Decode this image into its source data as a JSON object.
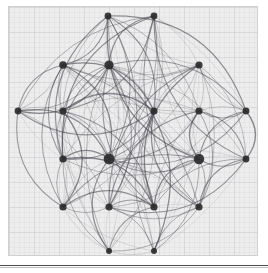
{
  "figure": {
    "title": "",
    "background_color": "#ededed",
    "page_color": "#ffffff",
    "border_color": "#d0d0d0",
    "rule_color": "#4a4a4a",
    "grid_visible": true,
    "grid_color": "#9696a0",
    "grid_major_step": 25,
    "grid_minor_step": 5
  },
  "chart_data": {
    "type": "scatter",
    "title": "",
    "subtitle": "",
    "xlabel": "",
    "ylabel": "",
    "xlim": [
      0,
      250
    ],
    "ylim": [
      0,
      250
    ],
    "grid": true,
    "legend_position": "none",
    "annotations": [],
    "tick_labels_x": [],
    "tick_labels_y": [],
    "node_color": "#2b2b2b",
    "edge_color": "#4a4a55",
    "node_count": 20,
    "edge_count": 150,
    "nodes": [
      {
        "id": "n0",
        "label": "",
        "x": 99,
        "y": 9,
        "size": 3.4,
        "degree": 14
      },
      {
        "id": "n1",
        "label": "",
        "x": 145,
        "y": 9,
        "size": 3.4,
        "degree": 13
      },
      {
        "id": "n2",
        "label": "",
        "x": 54,
        "y": 58,
        "size": 3.8,
        "degree": 16
      },
      {
        "id": "n3",
        "label": "",
        "x": 100,
        "y": 58,
        "size": 4.6,
        "degree": 24
      },
      {
        "id": "n4",
        "label": "",
        "x": 190,
        "y": 58,
        "size": 3.6,
        "degree": 15
      },
      {
        "id": "n5",
        "label": "",
        "x": 9,
        "y": 104,
        "size": 3.4,
        "degree": 12
      },
      {
        "id": "n6",
        "label": "",
        "x": 54,
        "y": 104,
        "size": 3.6,
        "degree": 17
      },
      {
        "id": "n7",
        "label": "",
        "x": 145,
        "y": 104,
        "size": 3.6,
        "degree": 16
      },
      {
        "id": "n8",
        "label": "",
        "x": 190,
        "y": 104,
        "size": 3.6,
        "degree": 16
      },
      {
        "id": "n9",
        "label": "",
        "x": 237,
        "y": 104,
        "size": 3.4,
        "degree": 12
      },
      {
        "id": "n10",
        "label": "",
        "x": 54,
        "y": 152,
        "size": 3.6,
        "degree": 17
      },
      {
        "id": "n11",
        "label": "",
        "x": 100,
        "y": 152,
        "size": 5.4,
        "degree": 30
      },
      {
        "id": "n12",
        "label": "",
        "x": 190,
        "y": 152,
        "size": 5.2,
        "degree": 29
      },
      {
        "id": "n13",
        "label": "",
        "x": 237,
        "y": 152,
        "size": 3.4,
        "degree": 12
      },
      {
        "id": "n14",
        "label": "",
        "x": 54,
        "y": 200,
        "size": 3.6,
        "degree": 15
      },
      {
        "id": "n15",
        "label": "",
        "x": 100,
        "y": 200,
        "size": 3.6,
        "degree": 16
      },
      {
        "id": "n16",
        "label": "",
        "x": 145,
        "y": 200,
        "size": 3.6,
        "degree": 16
      },
      {
        "id": "n17",
        "label": "",
        "x": 190,
        "y": 200,
        "size": 3.6,
        "degree": 15
      },
      {
        "id": "n18",
        "label": "",
        "x": 100,
        "y": 244,
        "size": 3.0,
        "degree": 9
      },
      {
        "id": "n19",
        "label": "",
        "x": 145,
        "y": 244,
        "size": 3.0,
        "degree": 9
      }
    ],
    "edges": [
      [
        "n0",
        "n3"
      ],
      [
        "n0",
        "n11"
      ],
      [
        "n0",
        "n12"
      ],
      [
        "n0",
        "n2"
      ],
      [
        "n0",
        "n6"
      ],
      [
        "n0",
        "n7"
      ],
      [
        "n0",
        "n10"
      ],
      [
        "n0",
        "n15"
      ],
      [
        "n0",
        "n16"
      ],
      [
        "n0",
        "n8"
      ],
      [
        "n0",
        "n4"
      ],
      [
        "n0",
        "n14"
      ],
      [
        "n0",
        "n17"
      ],
      [
        "n0",
        "n5"
      ],
      [
        "n1",
        "n3"
      ],
      [
        "n1",
        "n11"
      ],
      [
        "n1",
        "n12"
      ],
      [
        "n1",
        "n7"
      ],
      [
        "n1",
        "n8"
      ],
      [
        "n1",
        "n4"
      ],
      [
        "n1",
        "n16"
      ],
      [
        "n1",
        "n15"
      ],
      [
        "n1",
        "n17"
      ],
      [
        "n1",
        "n9"
      ],
      [
        "n1",
        "n13"
      ],
      [
        "n1",
        "n6"
      ],
      [
        "n1",
        "n10"
      ],
      [
        "n2",
        "n3"
      ],
      [
        "n2",
        "n6"
      ],
      [
        "n2",
        "n11"
      ],
      [
        "n2",
        "n12"
      ],
      [
        "n2",
        "n5"
      ],
      [
        "n2",
        "n10"
      ],
      [
        "n2",
        "n7"
      ],
      [
        "n2",
        "n14"
      ],
      [
        "n2",
        "n15"
      ],
      [
        "n2",
        "n8"
      ],
      [
        "n2",
        "n16"
      ],
      [
        "n2",
        "n4"
      ],
      [
        "n2",
        "n17"
      ],
      [
        "n2",
        "n18"
      ],
      [
        "n2",
        "n19"
      ],
      [
        "n3",
        "n4"
      ],
      [
        "n3",
        "n5"
      ],
      [
        "n3",
        "n6"
      ],
      [
        "n3",
        "n7"
      ],
      [
        "n3",
        "n8"
      ],
      [
        "n3",
        "n9"
      ],
      [
        "n3",
        "n10"
      ],
      [
        "n3",
        "n11"
      ],
      [
        "n3",
        "n12"
      ],
      [
        "n3",
        "n13"
      ],
      [
        "n3",
        "n14"
      ],
      [
        "n3",
        "n15"
      ],
      [
        "n3",
        "n16"
      ],
      [
        "n3",
        "n17"
      ],
      [
        "n3",
        "n18"
      ],
      [
        "n3",
        "n19"
      ],
      [
        "n4",
        "n7"
      ],
      [
        "n4",
        "n8"
      ],
      [
        "n4",
        "n9"
      ],
      [
        "n4",
        "n11"
      ],
      [
        "n4",
        "n12"
      ],
      [
        "n4",
        "n13"
      ],
      [
        "n4",
        "n16"
      ],
      [
        "n4",
        "n17"
      ],
      [
        "n4",
        "n15"
      ],
      [
        "n4",
        "n19"
      ],
      [
        "n4",
        "n6"
      ],
      [
        "n5",
        "n6"
      ],
      [
        "n5",
        "n10"
      ],
      [
        "n5",
        "n11"
      ],
      [
        "n5",
        "n14"
      ],
      [
        "n5",
        "n2"
      ],
      [
        "n5",
        "n3"
      ],
      [
        "n6",
        "n7"
      ],
      [
        "n6",
        "n10"
      ],
      [
        "n6",
        "n11"
      ],
      [
        "n6",
        "n12"
      ],
      [
        "n6",
        "n14"
      ],
      [
        "n6",
        "n15"
      ],
      [
        "n6",
        "n16"
      ],
      [
        "n6",
        "n18"
      ],
      [
        "n6",
        "n8"
      ],
      [
        "n7",
        "n8"
      ],
      [
        "n7",
        "n11"
      ],
      [
        "n7",
        "n12"
      ],
      [
        "n7",
        "n15"
      ],
      [
        "n7",
        "n16"
      ],
      [
        "n7",
        "n10"
      ],
      [
        "n7",
        "n17"
      ],
      [
        "n7",
        "n14"
      ],
      [
        "n7",
        "n19"
      ],
      [
        "n7",
        "n18"
      ],
      [
        "n8",
        "n9"
      ],
      [
        "n8",
        "n11"
      ],
      [
        "n8",
        "n12"
      ],
      [
        "n8",
        "n13"
      ],
      [
        "n8",
        "n16"
      ],
      [
        "n8",
        "n17"
      ],
      [
        "n8",
        "n15"
      ],
      [
        "n8",
        "n19"
      ],
      [
        "n9",
        "n12"
      ],
      [
        "n9",
        "n13"
      ],
      [
        "n9",
        "n8"
      ],
      [
        "n9",
        "n4"
      ],
      [
        "n9",
        "n17"
      ],
      [
        "n10",
        "n11"
      ],
      [
        "n10",
        "n12"
      ],
      [
        "n10",
        "n14"
      ],
      [
        "n10",
        "n15"
      ],
      [
        "n10",
        "n16"
      ],
      [
        "n10",
        "n18"
      ],
      [
        "n10",
        "n17"
      ],
      [
        "n11",
        "n12"
      ],
      [
        "n11",
        "n13"
      ],
      [
        "n11",
        "n14"
      ],
      [
        "n11",
        "n15"
      ],
      [
        "n11",
        "n16"
      ],
      [
        "n11",
        "n17"
      ],
      [
        "n11",
        "n18"
      ],
      [
        "n11",
        "n19"
      ],
      [
        "n11",
        "n9"
      ],
      [
        "n12",
        "n13"
      ],
      [
        "n12",
        "n14"
      ],
      [
        "n12",
        "n15"
      ],
      [
        "n12",
        "n16"
      ],
      [
        "n12",
        "n17"
      ],
      [
        "n12",
        "n18"
      ],
      [
        "n12",
        "n19"
      ],
      [
        "n13",
        "n17"
      ],
      [
        "n13",
        "n19"
      ],
      [
        "n13",
        "n16"
      ],
      [
        "n13",
        "n12"
      ],
      [
        "n14",
        "n15"
      ],
      [
        "n14",
        "n16"
      ],
      [
        "n14",
        "n18"
      ],
      [
        "n14",
        "n10"
      ],
      [
        "n14",
        "n19"
      ],
      [
        "n15",
        "n16"
      ],
      [
        "n15",
        "n18"
      ],
      [
        "n15",
        "n19"
      ],
      [
        "n15",
        "n17"
      ],
      [
        "n16",
        "n17"
      ],
      [
        "n16",
        "n18"
      ],
      [
        "n16",
        "n19"
      ],
      [
        "n17",
        "n19"
      ],
      [
        "n17",
        "n18"
      ],
      [
        "n18",
        "n19"
      ],
      [
        "n0",
        "n18"
      ],
      [
        "n1",
        "n19"
      ],
      [
        "n5",
        "n15"
      ],
      [
        "n9",
        "n16"
      ],
      [
        "n2",
        "n12"
      ],
      [
        "n4",
        "n10"
      ],
      [
        "n0",
        "n9"
      ],
      [
        "n1",
        "n5"
      ],
      [
        "n13",
        "n15"
      ],
      [
        "n5",
        "n7"
      ]
    ]
  }
}
